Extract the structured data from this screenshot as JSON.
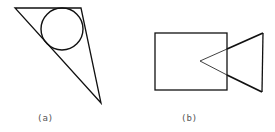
{
  "figures": [
    {
      "id": "a",
      "label": "(a)",
      "description": "triangle with inscribed circle"
    },
    {
      "id": "b",
      "label": "(b)",
      "description": "rectangle overlapping triangle"
    }
  ],
  "colors": {
    "stroke": "#111111",
    "label": "#555555",
    "background": "#ffffff"
  }
}
